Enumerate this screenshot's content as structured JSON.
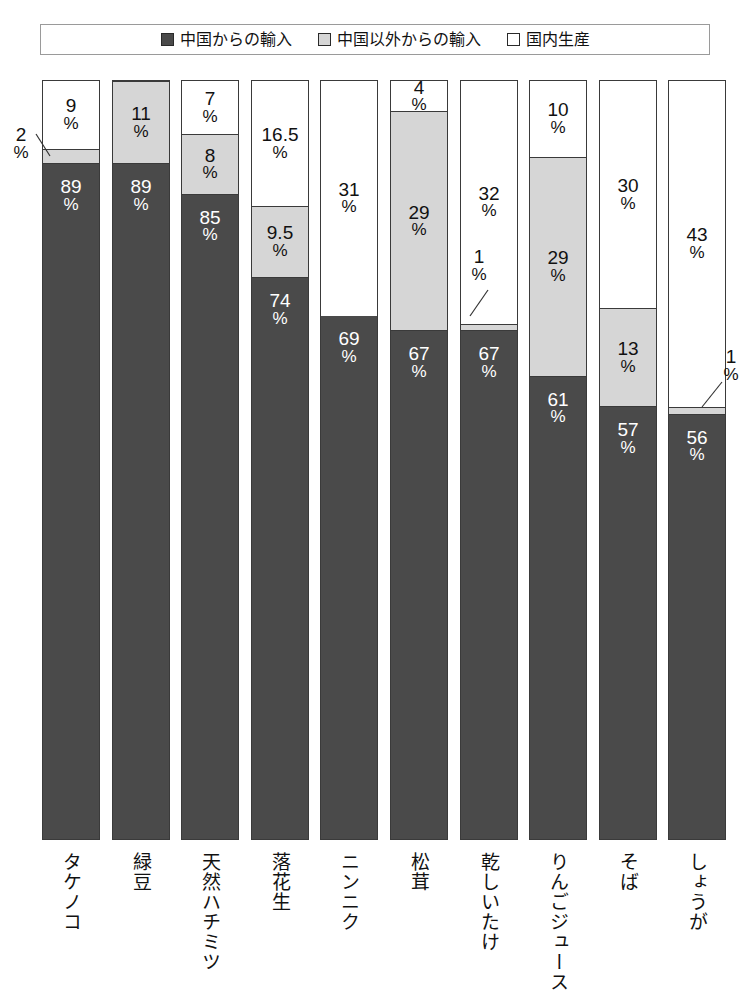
{
  "legend": {
    "items": [
      {
        "label": "中国からの輸入",
        "swatch": "dark",
        "color": "#4a4a4a"
      },
      {
        "label": "中国以外からの輸入",
        "swatch": "gray",
        "color": "#d6d6d6"
      },
      {
        "label": "国内生産",
        "swatch": "white",
        "color": "#ffffff"
      }
    ]
  },
  "chart_data": {
    "type": "bar",
    "title": "",
    "subtitle": "",
    "xlabel": "",
    "ylabel": "",
    "ylim": [
      0,
      100
    ],
    "grid": false,
    "stacked": true,
    "stack_order_bottom_to_top": [
      "中国からの輸入",
      "中国以外からの輸入",
      "国内生産"
    ],
    "legend_position": "top",
    "unit": "%",
    "categories": [
      "タケノコ",
      "緑豆",
      "天然ハチミツ",
      "落花生",
      "ニンニク",
      "松茸",
      "乾しいたけ",
      "りんごジュース",
      "そば",
      "しょうが"
    ],
    "series": [
      {
        "name": "中国からの輸入",
        "color": "#4a4a4a",
        "values": [
          89,
          89,
          85,
          74,
          69,
          67,
          67,
          61,
          57,
          56
        ],
        "labels": [
          "89",
          "89",
          "85",
          "74",
          "69",
          "67",
          "67",
          "61",
          "57",
          "56"
        ]
      },
      {
        "name": "中国以外からの輸入",
        "color": "#d6d6d6",
        "values": [
          2,
          11,
          8,
          9.5,
          0,
          29,
          1,
          29,
          13,
          1
        ],
        "labels": [
          "2",
          "11",
          "8",
          "9.5",
          "",
          "29",
          "1",
          "29",
          "13",
          "1"
        ]
      },
      {
        "name": "国内生産",
        "color": "#ffffff",
        "values": [
          9,
          0,
          7,
          16.5,
          31,
          4,
          32,
          10,
          30,
          43
        ],
        "labels": [
          "9",
          "",
          "7",
          "16.5",
          "31",
          "4",
          "32",
          "10",
          "30",
          "43"
        ]
      }
    ],
    "callouts": [
      {
        "category": "タケノコ",
        "series": "中国以外からの輸入",
        "value": "2",
        "pct": "%",
        "placement": "left-outside"
      },
      {
        "category": "乾しいたけ",
        "series": "中国以外からの輸入",
        "value": "1",
        "pct": "%",
        "placement": "inside-above"
      },
      {
        "category": "しょうが",
        "series": "中国以外からの輸入",
        "value": "1",
        "pct": "%",
        "placement": "right-outside"
      }
    ]
  }
}
